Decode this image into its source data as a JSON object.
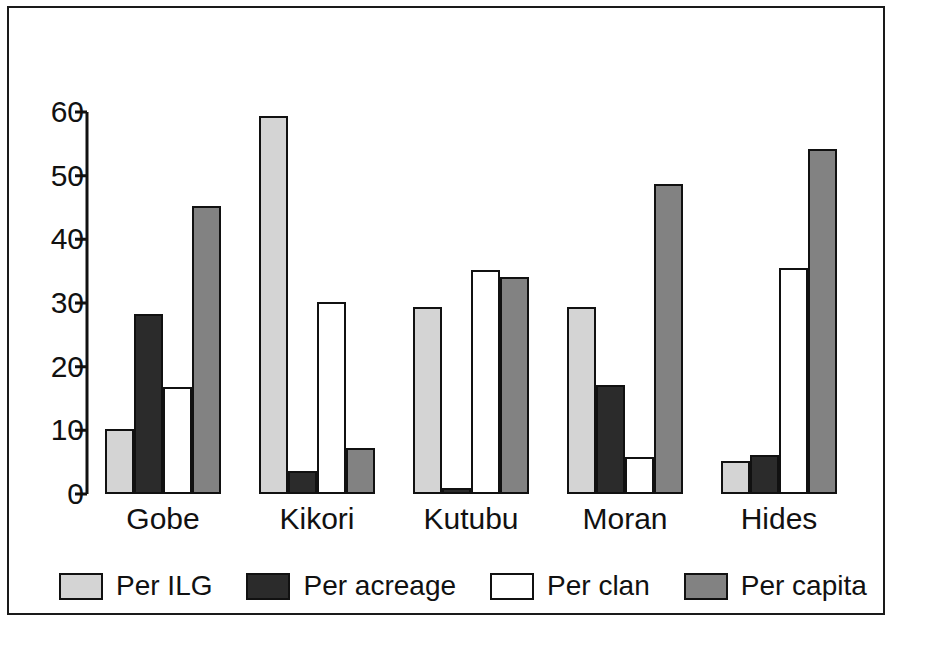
{
  "chart_data": {
    "type": "bar",
    "title": "",
    "subtitle": "",
    "xlabel": "",
    "ylabel": "",
    "categories": [
      "Gobe",
      "Kikori",
      "Kutubu",
      "Moran",
      "Hides"
    ],
    "series": [
      {
        "name": "Per ILG",
        "color": "#d4d4d4",
        "values": [
          10.2,
          59.4,
          29.3,
          29.4,
          5.2
        ]
      },
      {
        "name": "Per acreage",
        "color": "#2b2b2b",
        "values": [
          28.2,
          3.6,
          1.0,
          17.1,
          6.1
        ]
      },
      {
        "name": "Per clan",
        "color": "#ffffff",
        "values": [
          16.8,
          30.1,
          35.2,
          5.8,
          35.5
        ]
      },
      {
        "name": "Per capita",
        "color": "#828282",
        "values": [
          45.3,
          7.3,
          34.1,
          48.7,
          54.2
        ]
      }
    ],
    "ylim": [
      0,
      60
    ],
    "yticks": [
      0,
      10,
      20,
      30,
      40,
      50,
      60
    ],
    "ytick_labels": [
      "0",
      "10",
      "20",
      "30",
      "40",
      "50",
      "60"
    ],
    "grid": false,
    "legend_position": "bottom",
    "legend_entries": [
      "Per ILG",
      "Per acreage",
      "Per clan",
      "Per capita"
    ],
    "annotations": [],
    "frame_color": "#1a1a1a",
    "axis_color": "#111111"
  }
}
